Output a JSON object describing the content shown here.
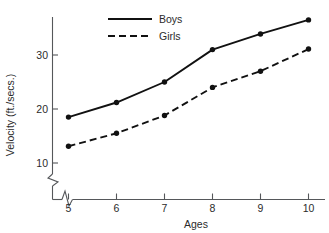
{
  "chart_data": {
    "type": "line",
    "title": "",
    "xlabel": "Ages",
    "ylabel": "Velocity (ft./secs.)",
    "categories": [
      5,
      6,
      7,
      8,
      9,
      10
    ],
    "x": [
      5,
      6,
      7,
      8,
      9,
      10
    ],
    "xtick_labels": [
      "5",
      "6",
      "7",
      "8",
      "9",
      "10"
    ],
    "ytick_labels": [
      "10",
      "20",
      "30"
    ],
    "yticks": [
      10,
      20,
      30
    ],
    "xlim": [
      4.6,
      10.5
    ],
    "ylim": [
      8.0,
      38.5
    ],
    "grid": false,
    "legend_position": "top-center",
    "axis_break_x": true,
    "axis_break_y": true,
    "marker": "filled-circle",
    "series": [
      {
        "name": "Boys",
        "linestyle": "solid",
        "values": [
          18.5,
          21.2,
          25.0,
          31.0,
          33.9,
          36.5
        ]
      },
      {
        "name": "Girls",
        "linestyle": "dashed",
        "values": [
          13.1,
          15.5,
          18.8,
          24.0,
          27.0,
          31.1
        ]
      }
    ],
    "colors": {
      "line": "#111111",
      "axis": "#55575a",
      "background": "#ffffff"
    }
  },
  "legend": {
    "items": [
      {
        "label": "Boys",
        "style": "solid"
      },
      {
        "label": "Girls",
        "style": "dashed"
      }
    ]
  },
  "axes": {
    "x_title": "Ages",
    "y_title": "Velocity (ft./secs.)",
    "x_ticks": [
      "5",
      "6",
      "7",
      "8",
      "9",
      "10"
    ],
    "y_ticks": [
      "30",
      "20",
      "10"
    ]
  }
}
